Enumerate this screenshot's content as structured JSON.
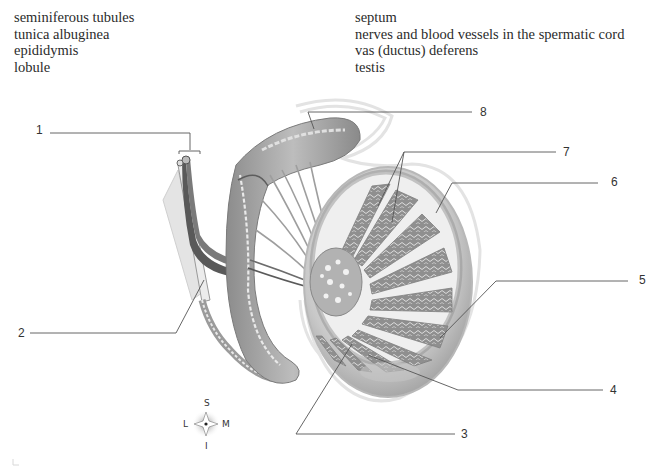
{
  "term_bank": {
    "left": [
      "seminiferous tubules",
      "tunica albuginea",
      "epididymis",
      "lobule"
    ],
    "right": [
      "septum",
      "nerves and blood vessels in the spermatic cord",
      "vas (ductus) deferens",
      "testis"
    ]
  },
  "callouts": [
    {
      "number": "1",
      "x": 36,
      "y": 124
    },
    {
      "number": "2",
      "x": 18,
      "y": 322
    },
    {
      "number": "3",
      "x": 462,
      "y": 426
    },
    {
      "number": "4",
      "x": 611,
      "y": 381
    },
    {
      "number": "5",
      "x": 640,
      "y": 270
    },
    {
      "number": "6",
      "x": 610,
      "y": 174
    },
    {
      "number": "7",
      "x": 564,
      "y": 145
    },
    {
      "number": "8",
      "x": 482,
      "y": 103
    }
  ],
  "compass": {
    "superior": "S",
    "inferior": "I",
    "lateral": "L",
    "medial": "M"
  },
  "colors": {
    "leader_line": "#555555",
    "tissue_dark": "#6e6e6e",
    "tissue_mid": "#a9a9a9",
    "tissue_light": "#d6d6d6",
    "outline_faint": "#e2e2e2"
  }
}
